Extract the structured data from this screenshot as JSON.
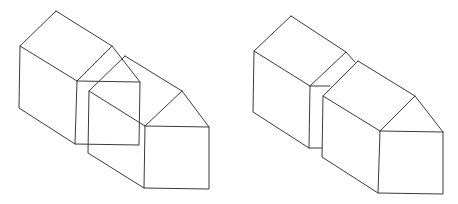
{
  "figure": {
    "stroke_color": "#3a3a3a",
    "background": "#ffffff",
    "panels": [
      {
        "id": "left",
        "label": "Overlapping houses (transparent, hidden lines shown)",
        "polylines": [
          [
            [
              56,
              11
            ],
            [
              20,
              46
            ],
            [
              19,
              108
            ],
            [
              75,
              144
            ],
            [
              139,
              145
            ],
            [
              140,
              82
            ],
            [
              112,
              46
            ],
            [
              56,
              11
            ]
          ],
          [
            [
              20,
              46
            ],
            [
              77,
              81
            ],
            [
              75,
              144
            ]
          ],
          [
            [
              77,
              81
            ],
            [
              112,
              46
            ]
          ],
          [
            [
              77,
              81
            ],
            [
              140,
              82
            ]
          ],
          [
            [
              125,
              56
            ],
            [
              89,
              91
            ],
            [
              88,
              153
            ],
            [
              144,
              188
            ],
            [
              209,
              189
            ],
            [
              209,
              127
            ],
            [
              182,
              91
            ],
            [
              125,
              56
            ]
          ],
          [
            [
              89,
              91
            ],
            [
              145,
              126
            ],
            [
              144,
              188
            ]
          ],
          [
            [
              145,
              126
            ],
            [
              182,
              91
            ]
          ],
          [
            [
              145,
              126
            ],
            [
              209,
              127
            ]
          ]
        ]
      },
      {
        "id": "right",
        "label": "Separated houses (hidden lines removed)",
        "polylines": [
          [
            [
              291,
              16
            ],
            [
              254,
              51
            ],
            [
              253,
              112
            ],
            [
              309,
              148
            ],
            [
              322,
              148
            ]
          ],
          [
            [
              254,
              51
            ],
            [
              310,
              86
            ],
            [
              309,
              148
            ]
          ],
          [
            [
              310,
              86
            ],
            [
              346,
              52
            ],
            [
              291,
              16
            ]
          ],
          [
            [
              346,
              52
            ],
            [
              355,
              62
            ]
          ],
          [
            [
              310,
              86
            ],
            [
              330,
              86
            ]
          ],
          [
            [
              358,
              61
            ],
            [
              323,
              96
            ],
            [
              322,
              157
            ],
            [
              378,
              193
            ],
            [
              443,
              194
            ],
            [
              443,
              132
            ],
            [
              415,
              96
            ],
            [
              358,
              61
            ]
          ],
          [
            [
              323,
              96
            ],
            [
              380,
              131
            ],
            [
              378,
              193
            ]
          ],
          [
            [
              380,
              131
            ],
            [
              415,
              96
            ]
          ],
          [
            [
              380,
              131
            ],
            [
              443,
              132
            ]
          ]
        ]
      }
    ]
  }
}
